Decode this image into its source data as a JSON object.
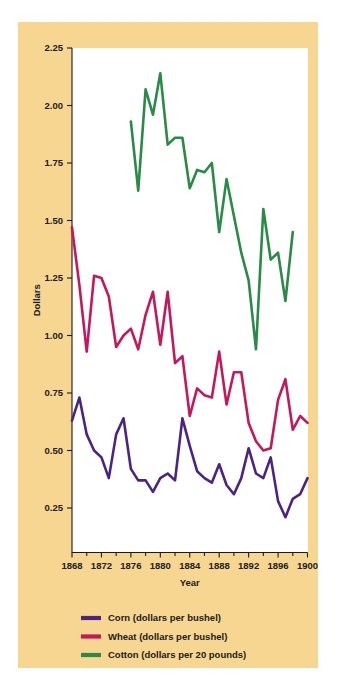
{
  "figure": {
    "background_color": "#FFFFFF",
    "panel_color": "#F6D691",
    "plot_background": "#FFFFFF"
  },
  "axes": {
    "y_title": "Dollars",
    "x_title": "Year",
    "y_ticks": [
      "0.25",
      "0.50",
      "0.75",
      "1.00",
      "1.25",
      "1.50",
      "1.75",
      "2.00",
      "2.25"
    ],
    "x_ticks": [
      "1868",
      "1872",
      "1876",
      "1880",
      "1884",
      "1888",
      "1892",
      "1896",
      "1900"
    ]
  },
  "legend": {
    "items": [
      {
        "label": "Corn (dollars per bushel)",
        "color": "#4B2382"
      },
      {
        "label": "Wheat (dollars per bushel)",
        "color": "#C4185C"
      },
      {
        "label": "Cotton (dollars per 20 pounds)",
        "color": "#2A8A47"
      }
    ]
  },
  "chart_data": {
    "type": "line",
    "title": "",
    "xlabel": "Year",
    "ylabel": "Dollars",
    "xlim": [
      1868,
      1900
    ],
    "ylim": [
      0.0,
      2.25
    ],
    "grid": false,
    "legend_position": "below-plot-left",
    "x": [
      1868,
      1869,
      1870,
      1871,
      1872,
      1873,
      1874,
      1875,
      1876,
      1877,
      1878,
      1879,
      1880,
      1881,
      1882,
      1883,
      1884,
      1885,
      1886,
      1887,
      1888,
      1889,
      1890,
      1891,
      1892,
      1893,
      1894,
      1895,
      1896,
      1897,
      1898,
      1899,
      1900
    ],
    "series": [
      {
        "name": "Corn (dollars per bushel)",
        "color": "#4B2382",
        "units": "dollars per bushel",
        "values": [
          0.63,
          0.73,
          0.57,
          0.5,
          0.47,
          0.38,
          0.57,
          0.64,
          0.42,
          0.37,
          0.37,
          0.32,
          0.38,
          0.4,
          0.37,
          0.64,
          0.52,
          0.41,
          0.38,
          0.36,
          0.44,
          0.35,
          0.31,
          0.38,
          0.51,
          0.4,
          0.38,
          0.47,
          0.28,
          0.21,
          0.29,
          0.31,
          0.38
        ]
      },
      {
        "name": "Wheat (dollars per bushel)",
        "color": "#C4185C",
        "units": "dollars per bushel",
        "values": [
          1.47,
          1.22,
          0.93,
          1.26,
          1.25,
          1.17,
          0.95,
          1.0,
          1.03,
          0.94,
          1.09,
          1.19,
          0.96,
          1.19,
          0.88,
          0.91,
          0.65,
          0.77,
          0.74,
          0.73,
          0.93,
          0.7,
          0.84,
          0.84,
          0.62,
          0.54,
          0.5,
          0.51,
          0.72,
          0.81,
          0.59,
          0.65,
          0.62
        ]
      },
      {
        "name": "Cotton (dollars per 20 pounds)",
        "color": "#2A8A47",
        "units": "dollars per 20 pounds",
        "values": [
          null,
          null,
          null,
          null,
          null,
          null,
          null,
          null,
          1.93,
          1.63,
          2.07,
          1.96,
          2.14,
          1.83,
          1.86,
          1.86,
          1.64,
          1.72,
          1.71,
          1.75,
          1.45,
          1.68,
          1.52,
          1.36,
          1.24,
          0.94,
          1.55,
          1.33,
          1.36,
          1.15,
          1.45,
          null,
          null
        ]
      }
    ]
  }
}
